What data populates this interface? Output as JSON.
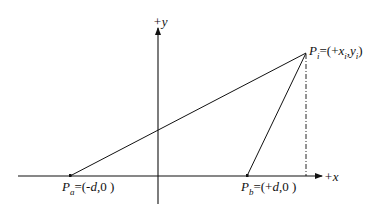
{
  "diagram": {
    "type": "coordinate-geometry",
    "axes": {
      "x_label": "+x",
      "y_label": "+y"
    },
    "points": {
      "pa": {
        "name": "P",
        "subscript": "a",
        "coords": "=(-d,0 )",
        "coords_parts": {
          "open": "=(-",
          "var": "d",
          "close": ",0 )"
        }
      },
      "pb": {
        "name": "P",
        "subscript": "b",
        "coords": "=(+d,0 )",
        "coords_parts": {
          "open": "=(+",
          "var": "d",
          "close": ",0 )"
        }
      },
      "pi": {
        "name": "P",
        "subscript": "i",
        "coords": "=(+xi,yi)",
        "coords_parts": {
          "open": "=(+",
          "x": "x",
          "xsub": "i",
          "sep": ",",
          "y": "y",
          "ysub": "i",
          "close": ")"
        }
      }
    },
    "colors": {
      "line": "#111111",
      "background": "#ffffff"
    }
  }
}
